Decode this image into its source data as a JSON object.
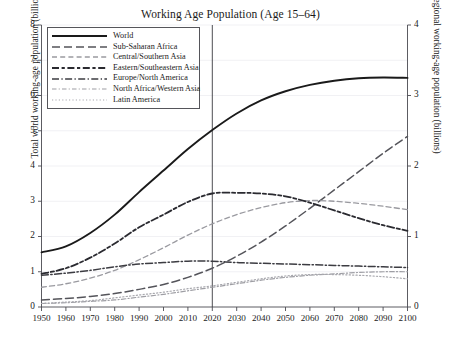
{
  "chart_data": {
    "type": "line",
    "title": "Working Age Population (Age 15–64)",
    "xlabel": "",
    "ylabel": "Total world working-age population (billions)",
    "ylabel_right": "Regional working-age population (billions)",
    "xlim": [
      1950,
      2100
    ],
    "ylim": [
      0,
      8
    ],
    "ylim_right": [
      0,
      4
    ],
    "grid": true,
    "grid_axis": "y",
    "legend_position": "upper left",
    "xticks": [
      1950,
      1960,
      1970,
      1980,
      1990,
      2000,
      2010,
      2020,
      2030,
      2040,
      2050,
      2060,
      2070,
      2080,
      2090,
      2100
    ],
    "xtick_labels": [
      "1950",
      "1960",
      "1970",
      "1980",
      "1990",
      "2000",
      "2010",
      "2020",
      "2030",
      "2040",
      "2050",
      "2060",
      "2070",
      "2080",
      "2090",
      "2100"
    ],
    "yticks": [
      0,
      1,
      2,
      3,
      4,
      5,
      6,
      7,
      8
    ],
    "ytick_labels": [
      "0",
      "1",
      "2",
      "3",
      "4",
      "5",
      "6",
      "7",
      "8"
    ],
    "yticks_right": [
      0,
      1,
      2,
      3,
      4
    ],
    "ytick_labels_right": [
      "0",
      "1",
      "2",
      "3",
      "4"
    ],
    "annotations": [
      {
        "type": "vline",
        "x": 2020,
        "label": "2020",
        "color": "#3a3a40"
      }
    ],
    "x": [
      1950,
      1960,
      1970,
      1980,
      1990,
      2000,
      2010,
      2020,
      2030,
      2040,
      2050,
      2060,
      2070,
      2080,
      2090,
      2100
    ],
    "series": [
      {
        "name": "World",
        "axis": "left",
        "style": "solid",
        "color": "#1a1a1a",
        "width": 1.9,
        "values": [
          1.55,
          1.72,
          2.1,
          2.62,
          3.26,
          3.87,
          4.48,
          5.02,
          5.49,
          5.86,
          6.12,
          6.3,
          6.42,
          6.49,
          6.51,
          6.5
        ]
      },
      {
        "name": "Sub-Saharan Africa",
        "axis": "right",
        "style": "long-dash",
        "color": "#54545a",
        "width": 1.5,
        "values": [
          0.1,
          0.12,
          0.15,
          0.19,
          0.25,
          0.32,
          0.42,
          0.55,
          0.72,
          0.92,
          1.15,
          1.4,
          1.66,
          1.92,
          2.18,
          2.42
        ]
      },
      {
        "name": "Central/Southern Asia",
        "axis": "right",
        "style": "med-dash",
        "color": "#9a9aa0",
        "width": 1.3,
        "values": [
          0.28,
          0.33,
          0.41,
          0.52,
          0.67,
          0.84,
          1.02,
          1.18,
          1.31,
          1.41,
          1.48,
          1.51,
          1.5,
          1.47,
          1.43,
          1.38
        ]
      },
      {
        "name": "Eastern/Southeastern Asia",
        "axis": "right",
        "style": "dash-dash",
        "color": "#2a2a30",
        "width": 1.8,
        "values": [
          0.47,
          0.55,
          0.7,
          0.9,
          1.13,
          1.31,
          1.49,
          1.61,
          1.62,
          1.61,
          1.57,
          1.48,
          1.37,
          1.26,
          1.16,
          1.08
        ]
      },
      {
        "name": "Europe/North America",
        "axis": "right",
        "style": "dash-dot",
        "color": "#3c3c42",
        "width": 1.5,
        "values": [
          0.45,
          0.48,
          0.52,
          0.57,
          0.61,
          0.63,
          0.65,
          0.65,
          0.63,
          0.62,
          0.61,
          0.6,
          0.59,
          0.58,
          0.57,
          0.56
        ]
      },
      {
        "name": "North Africa/Western Asia",
        "axis": "right",
        "style": "fine-dash-dot",
        "color": "#9e9ea4",
        "width": 1.2,
        "values": [
          0.05,
          0.06,
          0.08,
          0.1,
          0.14,
          0.18,
          0.23,
          0.28,
          0.33,
          0.38,
          0.42,
          0.45,
          0.47,
          0.49,
          0.5,
          0.5
        ]
      },
      {
        "name": "Latin America",
        "axis": "right",
        "style": "dotted",
        "color": "#a8a8ae",
        "width": 1.2,
        "values": [
          0.05,
          0.07,
          0.09,
          0.13,
          0.17,
          0.21,
          0.26,
          0.3,
          0.35,
          0.4,
          0.44,
          0.46,
          0.46,
          0.45,
          0.43,
          0.4
        ]
      }
    ]
  },
  "axes": {
    "left_label": "Total world working-age population (billions)",
    "right_label": "Regional working-age population (billions)"
  },
  "legend": {
    "items": [
      {
        "label": "World"
      },
      {
        "label": "Sub-Saharan Africa"
      },
      {
        "label": "Central/Southern Asia"
      },
      {
        "label": "Eastern/Southeastern Asia"
      },
      {
        "label": "Europe/North America"
      },
      {
        "label": "North Africa/Western Asia"
      },
      {
        "label": "Latin America"
      }
    ]
  }
}
